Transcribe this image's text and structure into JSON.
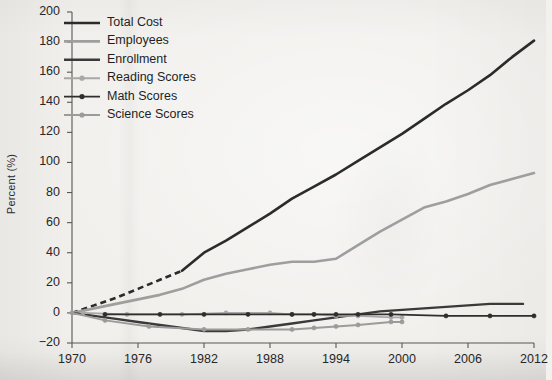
{
  "chart_data": {
    "type": "line",
    "title": "",
    "xlabel": "",
    "ylabel": "Percent (%)",
    "xlim": [
      1970,
      2012
    ],
    "ylim": [
      -20,
      200
    ],
    "yticks": [
      -20,
      0,
      20,
      40,
      60,
      80,
      100,
      120,
      140,
      160,
      180,
      200
    ],
    "ytick_labels": [
      "−20",
      "0",
      "20",
      "40",
      "60",
      "80",
      "100",
      "120",
      "140",
      "160",
      "180",
      "200"
    ],
    "xticks": [
      1970,
      1976,
      1982,
      1988,
      1994,
      2000,
      2006,
      2012
    ],
    "xtick_labels": [
      "1970",
      "1976",
      "1982",
      "1988",
      "1994",
      "2000",
      "2006",
      "2012"
    ],
    "grid": false,
    "legend_position": "upper-left",
    "series": [
      {
        "name": "Total Cost",
        "color": "#2b2b2b",
        "width": 2.6,
        "marker": "none",
        "dashed_until": 1980,
        "x": [
          1970,
          1972,
          1974,
          1976,
          1978,
          1980,
          1982,
          1984,
          1986,
          1988,
          1990,
          1992,
          1994,
          1996,
          1998,
          2000,
          2002,
          2004,
          2006,
          2008,
          2010,
          2012
        ],
        "y": [
          0,
          5,
          10,
          16,
          22,
          28,
          40,
          48,
          57,
          66,
          76,
          84,
          92,
          101,
          110,
          119,
          129,
          139,
          148,
          158,
          170,
          181
        ]
      },
      {
        "name": "Employees",
        "color": "#9e9e9e",
        "width": 2.6,
        "marker": "none",
        "x": [
          1970,
          1972,
          1974,
          1976,
          1978,
          1980,
          1982,
          1984,
          1986,
          1988,
          1990,
          1992,
          1994,
          1996,
          1998,
          2000,
          2002,
          2004,
          2006,
          2008,
          2010,
          2012
        ],
        "y": [
          0,
          3,
          6,
          9,
          12,
          16,
          22,
          26,
          29,
          32,
          34,
          34,
          36,
          45,
          54,
          62,
          70,
          74,
          79,
          85,
          89,
          93
        ]
      },
      {
        "name": "Enrollment",
        "color": "#3a3a3a",
        "width": 2.4,
        "marker": "none",
        "x": [
          1970,
          1972,
          1974,
          1976,
          1978,
          1980,
          1982,
          1984,
          1986,
          1988,
          1990,
          1992,
          1994,
          1996,
          1998,
          2000,
          2002,
          2004,
          2006,
          2008,
          2010,
          2011
        ],
        "y": [
          0,
          -2,
          -4,
          -6,
          -8,
          -10,
          -12,
          -12,
          -11,
          -9,
          -7,
          -5,
          -3,
          -1,
          1,
          2,
          3,
          4,
          5,
          6,
          6,
          6
        ]
      },
      {
        "name": "Reading Scores",
        "color": "#a8a8a8",
        "width": 1.9,
        "marker": "circle",
        "x": [
          1971,
          1975,
          1980,
          1984,
          1988,
          1990,
          1992,
          1994,
          1996,
          1999,
          2000
        ],
        "y": [
          0,
          -1,
          -1,
          0,
          0,
          -1,
          -1,
          -2,
          -2,
          -3,
          -3
        ]
      },
      {
        "name": "Math Scores",
        "color": "#2e2e2e",
        "width": 1.9,
        "marker": "circle",
        "x": [
          1973,
          1978,
          1982,
          1986,
          1990,
          1992,
          1994,
          1996,
          1999,
          2004,
          2008,
          2012
        ],
        "y": [
          -1,
          -1,
          -1,
          -1,
          -1,
          -1,
          -1,
          -1,
          -1,
          -2,
          -2,
          -2
        ]
      },
      {
        "name": "Science Scores",
        "color": "#9b9b9b",
        "width": 1.9,
        "marker": "circle",
        "x": [
          1970,
          1973,
          1977,
          1982,
          1986,
          1990,
          1992,
          1994,
          1996,
          1999,
          2000
        ],
        "y": [
          0,
          -5,
          -9,
          -11,
          -11,
          -11,
          -10,
          -9,
          -8,
          -6,
          -6
        ]
      }
    ]
  },
  "legend": {
    "items": [
      {
        "label": "Total Cost"
      },
      {
        "label": "Employees"
      },
      {
        "label": "Enrollment"
      },
      {
        "label": "Reading Scores"
      },
      {
        "label": "Math Scores"
      },
      {
        "label": "Science Scores"
      }
    ]
  }
}
